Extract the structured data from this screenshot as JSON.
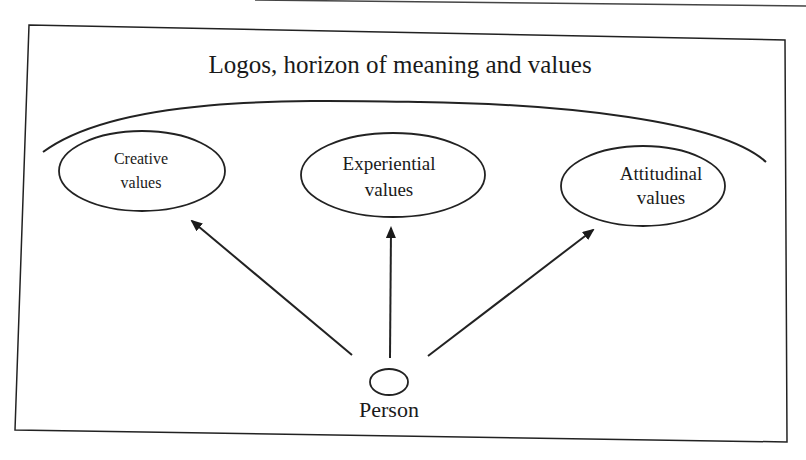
{
  "diagram": {
    "title": "Logos, horizon of meaning and values",
    "nodes": [
      {
        "id": "creative",
        "line1": "Creative",
        "line2": "values"
      },
      {
        "id": "experiential",
        "line1": "Experiential",
        "line2": "values"
      },
      {
        "id": "attitudinal",
        "line1": "Attitudinal",
        "line2": "values"
      }
    ],
    "source": {
      "id": "person",
      "label": "Person"
    },
    "edges": [
      {
        "from": "person",
        "to": "creative"
      },
      {
        "from": "person",
        "to": "experiential"
      },
      {
        "from": "person",
        "to": "attitudinal"
      }
    ],
    "colors": {
      "stroke": "#222222",
      "text": "#1a1a1a",
      "background": "#ffffff"
    }
  }
}
